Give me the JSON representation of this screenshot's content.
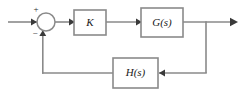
{
  "diagram": {
    "type": "control-system-block-diagram",
    "colors": {
      "wire": "#8a8a8a",
      "block_border": "#8a8a8a",
      "block_fill": "#ffffff",
      "text": "#1a1a1a",
      "arrow": "#3a3a3a",
      "background": "#ffffff"
    },
    "blocks": [
      {
        "id": "gain",
        "label": "K",
        "x": 74,
        "y": 10,
        "w": 32,
        "h": 25
      },
      {
        "id": "plant",
        "label": "G(s)",
        "x": 141,
        "y": 8,
        "w": 42,
        "h": 29
      },
      {
        "id": "feedback",
        "label": "H(s)",
        "x": 113,
        "y": 58,
        "w": 45,
        "h": 30
      }
    ],
    "summing_junction": {
      "id": "summer",
      "cx": 46,
      "cy": 22,
      "r": 9,
      "plus_sign": "+",
      "minus_sign": "−",
      "plus_x": 36,
      "plus_y": 10,
      "minus_x": 35,
      "minus_y": 34
    },
    "signals": {
      "input_label": "",
      "output_label": ""
    }
  }
}
